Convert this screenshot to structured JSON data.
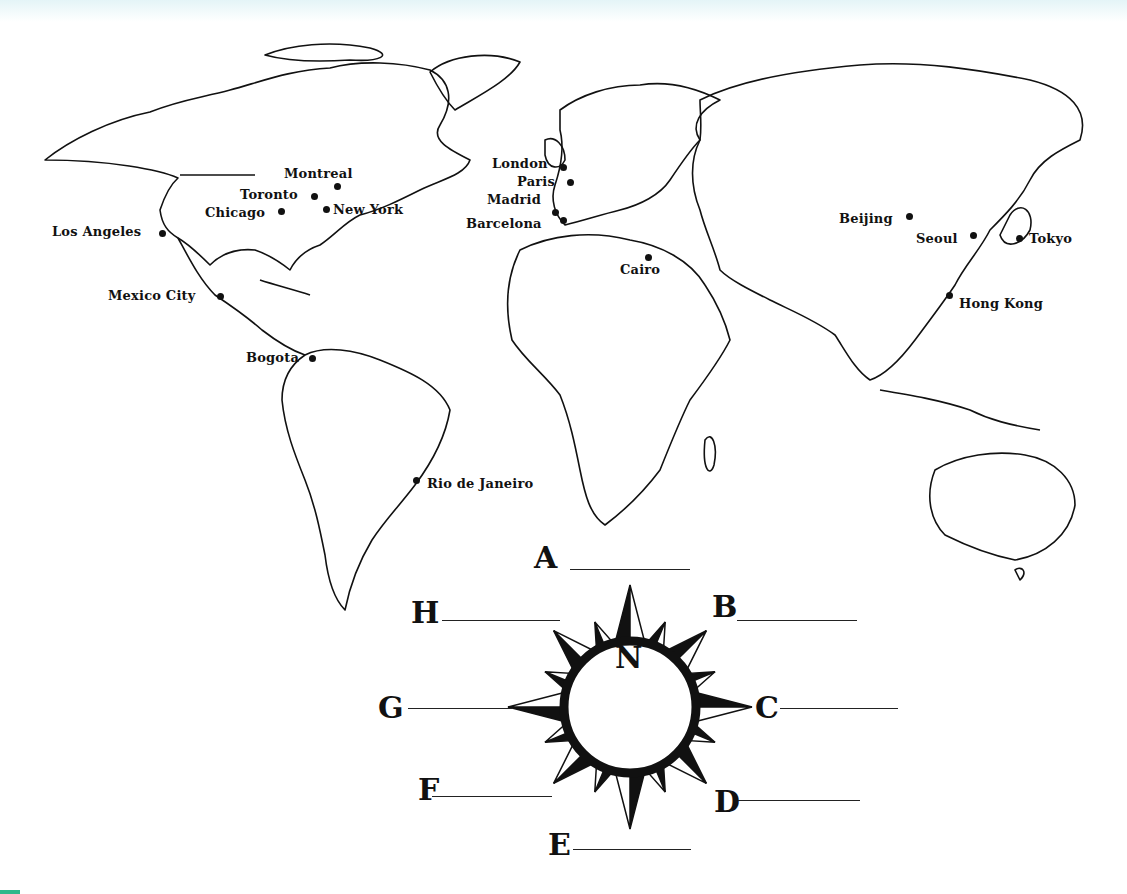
{
  "worksheet": {
    "type": "world map with compass rose",
    "colors": {
      "ink": "#111111",
      "paper": "#ffffff",
      "top_band": "#e4f4f7",
      "corner_mark": "#2fb88a"
    }
  },
  "cities": [
    {
      "name": "Montreal",
      "x": 337,
      "y": 186,
      "lx": 284,
      "ly": 166
    },
    {
      "name": "Toronto",
      "x": 314,
      "y": 196,
      "lx": 240,
      "ly": 187
    },
    {
      "name": "Chicago",
      "x": 281,
      "y": 211,
      "lx": 205,
      "ly": 205
    },
    {
      "name": "New York",
      "x": 326,
      "y": 209,
      "lx": 333,
      "ly": 202
    },
    {
      "name": "Los Angeles",
      "x": 162,
      "y": 233,
      "lx": 52,
      "ly": 224
    },
    {
      "name": "Mexico City",
      "x": 220,
      "y": 296,
      "lx": 108,
      "ly": 288
    },
    {
      "name": "Bogota",
      "x": 312,
      "y": 358,
      "lx": 246,
      "ly": 350
    },
    {
      "name": "Rio de Janeiro",
      "x": 416,
      "y": 480,
      "lx": 427,
      "ly": 476
    },
    {
      "name": "London",
      "x": 563,
      "y": 167,
      "lx": 492,
      "ly": 156
    },
    {
      "name": "Paris",
      "x": 570,
      "y": 182,
      "lx": 517,
      "ly": 174
    },
    {
      "name": "Madrid",
      "x": 555,
      "y": 212,
      "lx": 487,
      "ly": 192
    },
    {
      "name": "Barcelona",
      "x": 563,
      "y": 220,
      "lx": 466,
      "ly": 216
    },
    {
      "name": "Cairo",
      "x": 648,
      "y": 257,
      "lx": 620,
      "ly": 262
    },
    {
      "name": "Beijing",
      "x": 909,
      "y": 216,
      "lx": 839,
      "ly": 211
    },
    {
      "name": "Seoul",
      "x": 973,
      "y": 235,
      "lx": 916,
      "ly": 231
    },
    {
      "name": "Tokyo",
      "x": 1019,
      "y": 238,
      "lx": 1029,
      "ly": 231
    },
    {
      "name": "Hong Kong",
      "x": 949,
      "y": 295,
      "lx": 959,
      "ly": 296
    }
  ],
  "compass": {
    "center_label": "N",
    "blanks": [
      {
        "letter": "A",
        "direction": "north"
      },
      {
        "letter": "B",
        "direction": "northeast"
      },
      {
        "letter": "C",
        "direction": "east"
      },
      {
        "letter": "D",
        "direction": "southeast"
      },
      {
        "letter": "E",
        "direction": "south"
      },
      {
        "letter": "F",
        "direction": "southwest"
      },
      {
        "letter": "G",
        "direction": "west"
      },
      {
        "letter": "H",
        "direction": "northwest"
      }
    ]
  }
}
